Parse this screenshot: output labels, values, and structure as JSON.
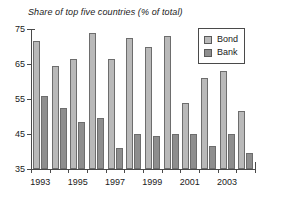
{
  "chart_data": {
    "type": "bar",
    "title": "Share of top five countries (% of total)",
    "xlabel": "",
    "ylabel": "",
    "ylim": [
      35,
      75
    ],
    "yticks": [
      35,
      45,
      55,
      65,
      75
    ],
    "grid": false,
    "legend_position": "top-right",
    "categories": [
      "1993",
      "1994",
      "1995",
      "1996",
      "1997",
      "1998",
      "1999",
      "2000",
      "2001",
      "2002",
      "2003",
      "2004"
    ],
    "xtick_labels": [
      "1993",
      "",
      "1995",
      "",
      "1997",
      "",
      "1999",
      "",
      "2001",
      "",
      "2003",
      ""
    ],
    "series": [
      {
        "name": "Bond",
        "color": "#b9b9b9",
        "values": [
          71.5,
          64.5,
          66.5,
          74.0,
          66.5,
          72.5,
          70.0,
          73.0,
          54.0,
          61.0,
          63.0,
          51.5
        ]
      },
      {
        "name": "Bank",
        "color": "#8e8e8e",
        "values": [
          56.0,
          52.5,
          48.5,
          49.5,
          41.0,
          45.0,
          44.5,
          45.0,
          45.0,
          41.5,
          45.0,
          39.5
        ]
      }
    ]
  },
  "legend": {
    "items": [
      {
        "label": "Bond",
        "swatch": "bond"
      },
      {
        "label": "Bank",
        "swatch": "bank"
      }
    ]
  }
}
